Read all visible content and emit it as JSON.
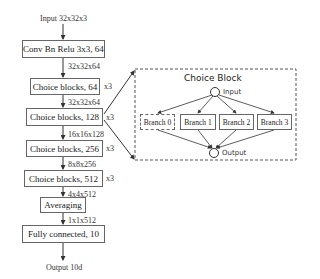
{
  "diagram": {
    "input_label": "Input 32x32x3",
    "output_label": "Output 10d",
    "layers": [
      {
        "label": "Conv Bn Relu 3x3, 64",
        "repeat": ""
      },
      {
        "label": "Choice blocks, 64",
        "repeat": "x3"
      },
      {
        "label": "Choice blocks, 128",
        "repeat": "x3"
      },
      {
        "label": "Choice blocks, 256",
        "repeat": "x3"
      },
      {
        "label": "Choice blocks, 512",
        "repeat": "x3"
      },
      {
        "label": "Averaging",
        "repeat": ""
      },
      {
        "label": "Fully connected, 10",
        "repeat": ""
      }
    ],
    "shapes": [
      "32x32x64",
      "32x32x64",
      "16x16x128",
      "8x8x256",
      "4x4x512",
      "1x1x512"
    ],
    "choice_block": {
      "title": "Choice Block",
      "input_label": "Input",
      "output_label": "Output",
      "branches": [
        "Branch 0",
        "Branch 1",
        "Branch 2",
        "Branch 3"
      ]
    }
  }
}
